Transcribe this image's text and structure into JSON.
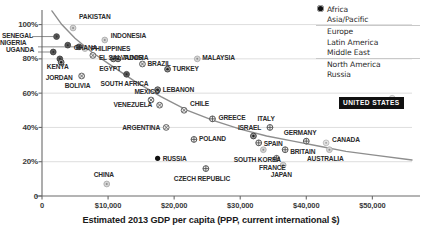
{
  "chart_data": {
    "type": "scatter",
    "title": "",
    "xlabel": "Estimated 2013 GDP per capita (PPP, current international $)",
    "ylabel": "",
    "xlim": [
      0,
      56000
    ],
    "ylim": [
      0,
      105
    ],
    "xticks": [
      {
        "value": 0,
        "label": "0"
      },
      {
        "value": 10000,
        "label": "$10,000"
      },
      {
        "value": 20000,
        "label": "$20,000"
      },
      {
        "value": 30000,
        "label": "$30,000"
      },
      {
        "value": 40000,
        "label": "$40,000"
      },
      {
        "value": 50000,
        "label": "$50,000"
      }
    ],
    "yticks": [
      {
        "value": 0,
        "label": "0"
      },
      {
        "value": 20,
        "label": "20%"
      },
      {
        "value": 40,
        "label": "40%"
      },
      {
        "value": 60,
        "label": "60%"
      },
      {
        "value": 80,
        "label": "80%"
      },
      {
        "value": 100,
        "label": "100%"
      }
    ],
    "grid": "horizontal",
    "legend_position": "top-right",
    "trendline": true,
    "series": [
      {
        "name": "Africa",
        "color": "#4d4d4d",
        "marker": "filled-circle"
      },
      {
        "name": "Asia/Pacific",
        "color": "#b3b3b3",
        "marker": "light-circle"
      },
      {
        "name": "Europe",
        "color": "#5a5a5a",
        "marker": "crosshair-circle"
      },
      {
        "name": "Latin America",
        "color": "#777777",
        "marker": "x-circle"
      },
      {
        "name": "Middle East",
        "color": "#3d3d3d",
        "marker": "dot-circle"
      },
      {
        "name": "North America",
        "color": "#9a9a9a",
        "marker": "faint-circle"
      },
      {
        "name": "Russia",
        "color": "#1a1a1a",
        "marker": "solid-dot"
      }
    ],
    "points": [
      {
        "label": "PAKISTAN",
        "group": "Asia/Pacific",
        "x": 4700,
        "y": 98
      },
      {
        "label": "SENEGAL",
        "group": "Africa",
        "x": 2200,
        "y": 93
      },
      {
        "label": "NIGERIA",
        "group": "Africa",
        "x": 5600,
        "y": 87
      },
      {
        "label": "UGANDA",
        "group": "Africa",
        "x": 1700,
        "y": 84
      },
      {
        "label": "INDONESIA",
        "group": "Asia/Pacific",
        "x": 9500,
        "y": 91
      },
      {
        "label": "GHANA",
        "group": "Africa",
        "x": 3900,
        "y": 88
      },
      {
        "label": "PHILIPPINES",
        "group": "Asia/Pacific",
        "x": 6500,
        "y": 86
      },
      {
        "label": "EL SALVADOR",
        "group": "Latin America",
        "x": 7700,
        "y": 82
      },
      {
        "label": "KENYA",
        "group": "Africa",
        "x": 2700,
        "y": 80
      },
      {
        "label": "JORDAN",
        "group": "Middle East",
        "x": 2900,
        "y": 78
      },
      {
        "label": "EGYPT",
        "group": "Middle East",
        "x": 10800,
        "y": 80
      },
      {
        "label": "TUNISIA",
        "group": "Middle East",
        "x": 11500,
        "y": 80
      },
      {
        "label": "MALAYSIA",
        "group": "Asia/Pacific",
        "x": 23500,
        "y": 80
      },
      {
        "label": "BRAZIL",
        "group": "Latin America",
        "x": 15200,
        "y": 77
      },
      {
        "label": "TURKEY",
        "group": "Middle East",
        "x": 19000,
        "y": 74
      },
      {
        "label": "BOLIVIA",
        "group": "Latin America",
        "x": 6000,
        "y": 70
      },
      {
        "label": "SOUTH AFRICA",
        "group": "Africa",
        "x": 12800,
        "y": 71
      },
      {
        "label": "LEBANON",
        "group": "Middle East",
        "x": 17500,
        "y": 62
      },
      {
        "label": "VENEZUELA",
        "group": "Latin America",
        "x": 17800,
        "y": 53
      },
      {
        "label": "MEXICO",
        "group": "Latin America",
        "x": 16500,
        "y": 56
      },
      {
        "label": "CHILE",
        "group": "Latin America",
        "x": 21500,
        "y": 50
      },
      {
        "label": "GREECE",
        "group": "Europe",
        "x": 25800,
        "y": 45
      },
      {
        "label": "ARGENTINA",
        "group": "Latin America",
        "x": 18800,
        "y": 40
      },
      {
        "label": "ITALY",
        "group": "Europe",
        "x": 34500,
        "y": 40
      },
      {
        "label": "POLAND",
        "group": "Europe",
        "x": 23000,
        "y": 33
      },
      {
        "label": "ISRAEL",
        "group": "Middle East",
        "x": 32000,
        "y": 35
      },
      {
        "label": "SPAIN",
        "group": "Europe",
        "x": 32800,
        "y": 31
      },
      {
        "label": "GERMANY",
        "group": "Europe",
        "x": 40000,
        "y": 32
      },
      {
        "label": "CANADA",
        "group": "North America",
        "x": 43000,
        "y": 31
      },
      {
        "label": "AUSTRALIA",
        "group": "Asia/Pacific",
        "x": 43500,
        "y": 27
      },
      {
        "label": "SOUTH KOREA",
        "group": "Asia/Pacific",
        "x": 33500,
        "y": 27
      },
      {
        "label": "BRITAIN",
        "group": "Europe",
        "x": 36800,
        "y": 27
      },
      {
        "label": "FRANCE",
        "group": "Europe",
        "x": 35500,
        "y": 22
      },
      {
        "label": "JAPAN",
        "group": "Asia/Pacific",
        "x": 36500,
        "y": 18
      },
      {
        "label": "RUSSIA",
        "group": "Russia",
        "x": 17500,
        "y": 22
      },
      {
        "label": "CZECH REPUBLIC",
        "group": "Europe",
        "x": 24800,
        "y": 16
      },
      {
        "label": "CHINA",
        "group": "Asia/Pacific",
        "x": 9800,
        "y": 7
      },
      {
        "label": "UNITED STATES",
        "group": "North America",
        "x": 53000,
        "y": 57
      }
    ],
    "callout": {
      "label": "UNITED STATES"
    }
  }
}
